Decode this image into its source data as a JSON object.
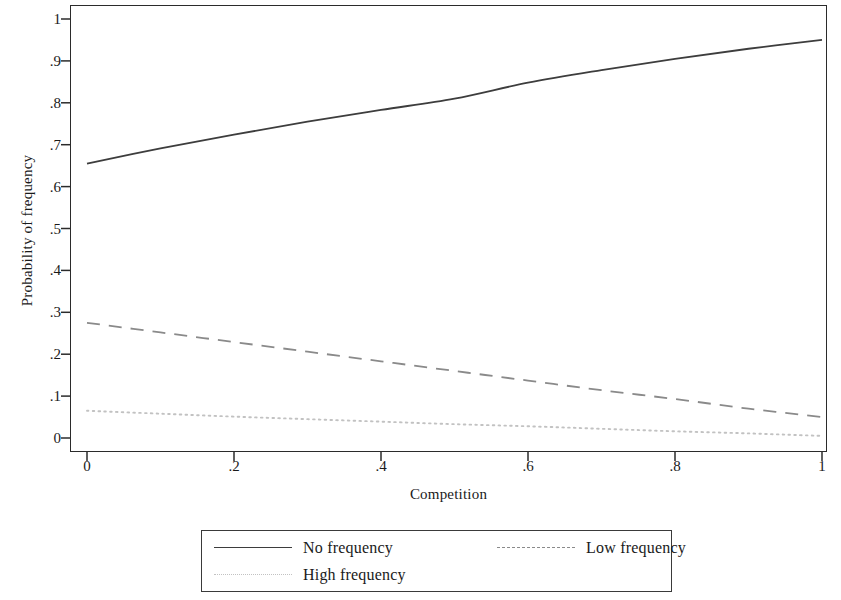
{
  "chart_data": {
    "type": "line",
    "title": "",
    "xlabel": "Competition",
    "ylabel": "Probability of frequency",
    "xlim": [
      0,
      1
    ],
    "ylim": [
      0,
      1
    ],
    "grid": false,
    "legend_position": "bottom",
    "x_ticks": [
      "0",
      ".2",
      ".4",
      ".6",
      ".8",
      "1"
    ],
    "x_tick_values": [
      0,
      0.2,
      0.4,
      0.6,
      0.8,
      1
    ],
    "y_ticks": [
      "0",
      ".1",
      ".2",
      ".3",
      ".4",
      ".5",
      ".6",
      ".7",
      ".8",
      ".9",
      "1"
    ],
    "y_tick_values": [
      0,
      0.1,
      0.2,
      0.3,
      0.4,
      0.5,
      0.6,
      0.7,
      0.8,
      0.9,
      1
    ],
    "x": [
      0,
      0.1,
      0.2,
      0.3,
      0.4,
      0.5,
      0.6,
      0.7,
      0.8,
      0.9,
      1
    ],
    "series": [
      {
        "name": "No frequency",
        "style": "solid",
        "color": "#3d3d3d",
        "values": [
          0.655,
          0.691,
          0.724,
          0.755,
          0.783,
          0.81,
          0.848,
          0.878,
          0.905,
          0.929,
          0.95
        ]
      },
      {
        "name": "Low frequency",
        "style": "dashed",
        "color": "#8a8a8a",
        "values": [
          0.275,
          0.252,
          0.229,
          0.206,
          0.183,
          0.16,
          0.137,
          0.114,
          0.093,
          0.07,
          0.05
        ]
      },
      {
        "name": "High frequency",
        "style": "dotted",
        "color": "#c2c2c2",
        "values": [
          0.065,
          0.058,
          0.051,
          0.045,
          0.039,
          0.033,
          0.028,
          0.022,
          0.016,
          0.011,
          0.005
        ]
      }
    ]
  },
  "legend": {
    "entries": [
      {
        "label": "No frequency",
        "style": "solid"
      },
      {
        "label": "Low frequency",
        "style": "dashed"
      },
      {
        "label": "High frequency",
        "style": "dotted"
      }
    ]
  }
}
